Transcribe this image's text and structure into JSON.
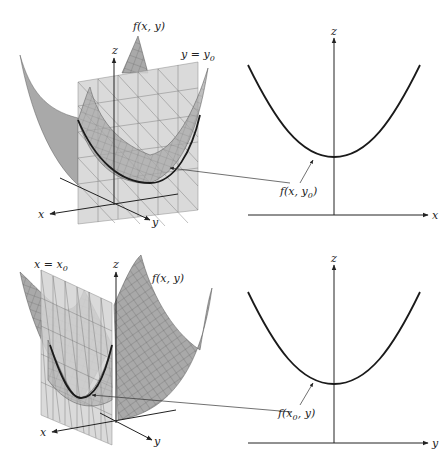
{
  "figure": {
    "top_row": {
      "surface_label": "f(x, y)",
      "plane_label": "y = y",
      "plane_label_sub": "0",
      "axis_labels": {
        "x": "x",
        "y": "y",
        "z": "z"
      },
      "trace_label": "f(x, y",
      "trace_label_sub": "0",
      "trace_label_close": ")",
      "section_axis_labels": {
        "horizontal": "x",
        "vertical": "z"
      }
    },
    "bottom_row": {
      "surface_label": "f(x, y)",
      "plane_label": "x = x",
      "plane_label_sub": "0",
      "axis_labels": {
        "x": "x",
        "y": "y",
        "z": "z"
      },
      "trace_label": "f(x",
      "trace_label_sub": "0",
      "trace_label_close": ", y)",
      "section_axis_labels": {
        "horizontal": "y",
        "vertical": "z"
      }
    }
  },
  "colors": {
    "surface": "#a9a9a9",
    "plane": "#d4d4d4",
    "curve": "#1a1a1a",
    "background": "#ffffff"
  }
}
